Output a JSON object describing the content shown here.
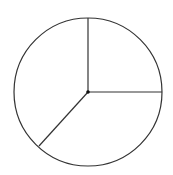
{
  "chart_data": {
    "type": "pie",
    "title": "",
    "slices": [
      {
        "label": "",
        "value": 25,
        "start_deg": 90,
        "end_deg": 0
      },
      {
        "label": "",
        "value": 37,
        "start_deg": 0,
        "end_deg": -133
      },
      {
        "label": "",
        "value": 38,
        "start_deg": -133,
        "end_deg": -270
      }
    ],
    "fill": "none",
    "stroke_color": "#333333",
    "legend": "none",
    "center_dot": true
  },
  "geometry": {
    "cx": 88,
    "cy": 92,
    "r": 74,
    "spokes": [
      {
        "x2": 88,
        "y2": 18
      },
      {
        "x2": 162,
        "y2": 92
      },
      {
        "x2": 39,
        "y2": 146
      }
    ]
  },
  "colors": {
    "stroke": "#333333",
    "background": "#ffffff"
  }
}
